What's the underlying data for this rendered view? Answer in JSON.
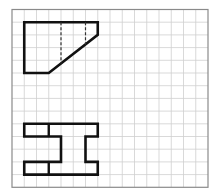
{
  "figure": {
    "colors": {
      "background": "#ffffff",
      "grid_line": "#cfcfcf",
      "grid_border": "#8a8a8a",
      "outline": "#111111",
      "hidden_line": "#333333"
    }
  },
  "grid": {
    "origin_x": 12,
    "origin_y": 9.5,
    "cols": 16,
    "rows": 14,
    "cell_w": 12.25,
    "cell_h": 12.7
  },
  "shapes": {
    "top_view": {
      "name": "Top view outline",
      "outline": [
        [
          1,
          1
        ],
        [
          7,
          1
        ],
        [
          7,
          2
        ],
        [
          3,
          5
        ],
        [
          1,
          5
        ]
      ],
      "hidden_lines": [
        [
          [
            4,
            1
          ],
          [
            4,
            4.25
          ]
        ],
        [
          [
            6,
            1
          ],
          [
            6,
            2.75
          ]
        ]
      ]
    },
    "front_view": {
      "name": "Front view I-beam",
      "outline": [
        [
          1,
          9
        ],
        [
          7,
          9
        ],
        [
          7,
          10
        ],
        [
          6,
          10
        ],
        [
          6,
          12
        ],
        [
          7,
          12
        ],
        [
          7,
          13
        ],
        [
          1,
          13
        ],
        [
          1,
          12
        ],
        [
          4,
          12
        ],
        [
          4,
          10
        ],
        [
          1,
          10
        ]
      ],
      "inner_lines": [
        [
          [
            3,
            9
          ],
          [
            3,
            10
          ]
        ],
        [
          [
            3,
            12
          ],
          [
            3,
            13
          ]
        ]
      ]
    }
  }
}
